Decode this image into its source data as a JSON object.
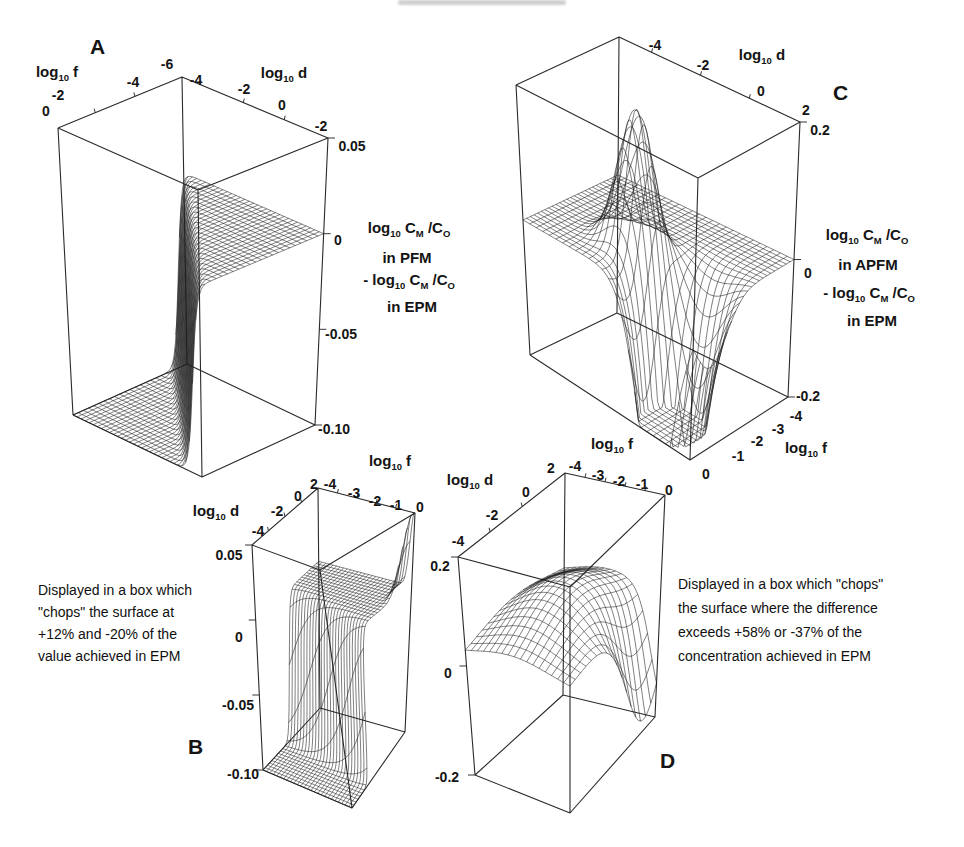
{
  "sym": {
    "log": "log",
    "sub10": "10",
    "cM": " C",
    "M": "M",
    "cO": " /C",
    "O": "O",
    "minus": "- "
  },
  "panels": {
    "A": {
      "letter": "A",
      "f_suffix": " f",
      "d_suffix": " d",
      "f_ticks": [
        "0",
        "-2",
        "-4",
        "-6"
      ],
      "d_ticks": [
        "-4",
        "-2",
        "0",
        "-2"
      ],
      "z_ticks": [
        "0.05",
        "0",
        "-0.05",
        "-0.10"
      ],
      "method": "in PFM",
      "ref": "in EPM"
    },
    "B": {
      "letter": "B",
      "f_suffix": " f",
      "d_suffix": " d",
      "d_ticks": [
        "-4",
        "-2",
        "0",
        "2"
      ],
      "f_ticks": [
        "-4",
        "-3",
        "-2",
        "-1",
        "0"
      ],
      "z_ticks": [
        "0.05",
        "0",
        "-0.05",
        "-0.10"
      ]
    },
    "C": {
      "letter": "C",
      "f_suffix": " f",
      "d_suffix": " d",
      "d_ticks": [
        "-4",
        "-2",
        "0",
        "2"
      ],
      "f_ticks": [
        "-4",
        "-3",
        "-2",
        "-1",
        "0"
      ],
      "z_ticks": [
        "0.2",
        "0",
        "-0.2"
      ],
      "method": "in APFM",
      "ref": "in EPM"
    },
    "D": {
      "letter": "D",
      "f_suffix": " f",
      "d_suffix": " d",
      "f_ticks": [
        "-4",
        "-3",
        "-2",
        "-1",
        "0"
      ],
      "d_ticks": [
        "2",
        "0",
        "-2",
        "-4"
      ],
      "z_ticks": [
        "0.2",
        "0",
        "-0.2"
      ]
    }
  },
  "captions": {
    "left": [
      "Displayed in a box which",
      "\"chops\" the surface at",
      "+12% and -20% of the",
      "value achieved in EPM"
    ],
    "right": [
      "Displayed in a box which \"chops\"",
      "the surface where the difference",
      "exceeds +58% or -37% of the",
      "concentration achieved in EPM"
    ]
  },
  "chart_data": [
    {
      "id": "A",
      "type": "surface3d",
      "x_axis": {
        "label": "log10 f",
        "ticks": [
          "0",
          "-2",
          "-4",
          "-6"
        ]
      },
      "y_axis": {
        "label": "log10 d",
        "ticks": [
          "-4",
          "-2",
          "0",
          "-2"
        ]
      },
      "z_axis": {
        "label": "log10 CM/CO in PFM - log10 CM/CO in EPM",
        "range": [
          -0.1,
          0.05
        ],
        "ticks": [
          0.05,
          0,
          -0.05,
          -0.1
        ]
      },
      "surface": "difference ~0 over most of domain; plunges below -0.10 (clipped at box floor) across a diagonal cliff; flat mesh at z=0 on the high-d side, mesh on floor at z=-0.10 on the low side, near-vertical striped wall between",
      "model": {
        "type": "cliff",
        "wmax": 0.6667,
        "c": 0.94,
        "s": 0.02,
        "nu": 22,
        "nv": 32
      }
    },
    {
      "id": "B",
      "type": "surface3d",
      "x_axis": {
        "label": "log10 d",
        "ticks": [
          "-4",
          "-2",
          "0",
          "2"
        ]
      },
      "y_axis": {
        "label": "log10 f",
        "ticks": [
          "-4",
          "-3",
          "-2",
          "-1",
          "0"
        ]
      },
      "z_axis": {
        "range": [
          -0.1,
          0.05
        ],
        "ticks": [
          0.05,
          0,
          -0.05,
          -0.1
        ]
      },
      "surface": "same difference surface chopped at +12% / -20%: plateau mesh at z=0 behind, striped curtain dropping to the -0.10 floor across the front, floor mesh at bottom, thin striped column rising to +0.05 at the f=0 corner",
      "model": {
        "type": "cliff_col",
        "wmax": 0.6667,
        "a": 0.5,
        "b": 0.15,
        "s": 0.02,
        "colH": 0.36,
        "cv": 0.05,
        "cu": 0.16,
        "nu": 26,
        "nv": 26
      }
    },
    {
      "id": "C",
      "type": "surface3d",
      "x_axis": {
        "label": "log10 d",
        "ticks": [
          "-4",
          "-2",
          "0",
          "2"
        ]
      },
      "y_axis": {
        "label": "log10 f",
        "ticks": [
          "-4",
          "-3",
          "-2",
          "-1",
          "0"
        ]
      },
      "z_axis": {
        "label": "log10 CM/CO in APFM - log10 CM/CO in EPM",
        "range": [
          -0.2,
          0.2
        ],
        "ticks": [
          0.2,
          0,
          -0.2
        ]
      },
      "surface": "mesh plane at z=0 with a tall sharp peak (reaching ~+0.2) near the middle and a deep narrow trench plunging below -0.2 toward the front corner",
      "model": {
        "type": "peak_trench",
        "base": 0.5,
        "ph": 0.52,
        "pu": 0.35,
        "pv": 0.47,
        "pru": 0.13,
        "prv": 0.13,
        "th": 1.4,
        "tu": 0.18,
        "tv": 0.78,
        "tru": 0.22,
        "trv": 0.16,
        "nu": 26,
        "nv": 26
      }
    },
    {
      "id": "D",
      "type": "surface3d",
      "x_axis": {
        "label": "log10 f",
        "ticks": [
          "-4",
          "-3",
          "-2",
          "-1",
          "0"
        ]
      },
      "y_axis": {
        "label": "log10 d",
        "ticks": [
          "2",
          "0",
          "-2",
          "-4"
        ]
      },
      "z_axis": {
        "range": [
          -0.2,
          0.2
        ],
        "ticks": [
          0.2,
          0,
          -0.2
        ]
      },
      "surface": "dome-shaped mesh sitting just above z=0, chopped at the box walls, with a fold on the right side hanging down below z=0",
      "model": {
        "type": "dome_fold",
        "base": 0.54,
        "dh": 0.2,
        "du": 0.5,
        "dv": 0.45,
        "dru": 0.5,
        "drv": 0.5,
        "fh": 0.6,
        "fu": 0.85,
        "fv": 1.08,
        "fru": 0.3,
        "frv": 0.22,
        "wmin": 0.04,
        "nu": 17,
        "nv": 17
      }
    }
  ]
}
